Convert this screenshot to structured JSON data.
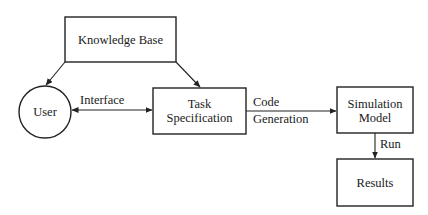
{
  "diagram": {
    "type": "flowchart",
    "nodes": [
      {
        "id": "knowledge_base",
        "label": "Knowledge Base",
        "shape": "rectangle"
      },
      {
        "id": "user",
        "label": "User",
        "shape": "circle"
      },
      {
        "id": "task_spec",
        "label_lines": [
          "Task",
          "Specification"
        ],
        "shape": "rectangle"
      },
      {
        "id": "sim_model",
        "label_lines": [
          "Simulation",
          "Model"
        ],
        "shape": "rectangle"
      },
      {
        "id": "results",
        "label": "Results",
        "shape": "rectangle"
      }
    ],
    "edges": [
      {
        "from": "knowledge_base",
        "to": "user",
        "label": ""
      },
      {
        "from": "knowledge_base",
        "to": "task_spec",
        "label": ""
      },
      {
        "from": "user",
        "to": "task_spec",
        "label": "Interface",
        "bidirectional": true
      },
      {
        "from": "task_spec",
        "to": "sim_model",
        "label_lines": [
          "Code",
          "Generation"
        ]
      },
      {
        "from": "sim_model",
        "to": "results",
        "label": "Run"
      }
    ]
  },
  "labels": {
    "knowledge_base": "Knowledge Base",
    "user": "User",
    "task_spec_line1": "Task",
    "task_spec_line2": "Specification",
    "sim_model_line1": "Simulation",
    "sim_model_line2": "Model",
    "results": "Results",
    "interface": "Interface",
    "code": "Code",
    "generation": "Generation",
    "run": "Run"
  },
  "colors": {
    "stroke": "#222222",
    "background": "#ffffff",
    "text": "#1a1a1a"
  }
}
